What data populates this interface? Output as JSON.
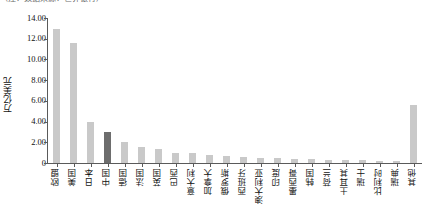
{
  "figure": {
    "top_caption": "（注：数据来源：世界银行）"
  },
  "chart_data": {
    "type": "bar",
    "title": "",
    "xlabel": "",
    "ylabel": "万亿美元",
    "ylim": [
      0,
      14
    ],
    "ytick_values": [
      0,
      2,
      4,
      6,
      8,
      10,
      12,
      14
    ],
    "ytick_labels": [
      "0",
      "2.00",
      "4.00",
      "6.00",
      "8.00",
      "10.00",
      "12.00",
      "14.00"
    ],
    "grid": false,
    "legend": "none",
    "highlight_category": "中国",
    "colors": {
      "bar": "#c9c9c9",
      "highlight": "#6d6d6d",
      "axis": "#5a5a5a",
      "text": "#111111"
    },
    "categories": [
      "欧盟",
      "美国",
      "日本",
      "中国",
      "德国",
      "法国",
      "英国",
      "巴西",
      "意大利",
      "加拿大",
      "俄罗斯",
      "西班牙",
      "澳大利亚",
      "印度",
      "墨西哥",
      "韩国",
      "荷兰",
      "土耳其",
      "瑞士",
      "比利时",
      "瑞典",
      "其他"
    ],
    "values": [
      12.9,
      11.6,
      4.0,
      3.0,
      2.0,
      1.55,
      1.35,
      1.0,
      0.95,
      0.8,
      0.7,
      0.55,
      0.5,
      0.45,
      0.4,
      0.38,
      0.33,
      0.28,
      0.25,
      0.22,
      0.2,
      5.6
    ]
  }
}
